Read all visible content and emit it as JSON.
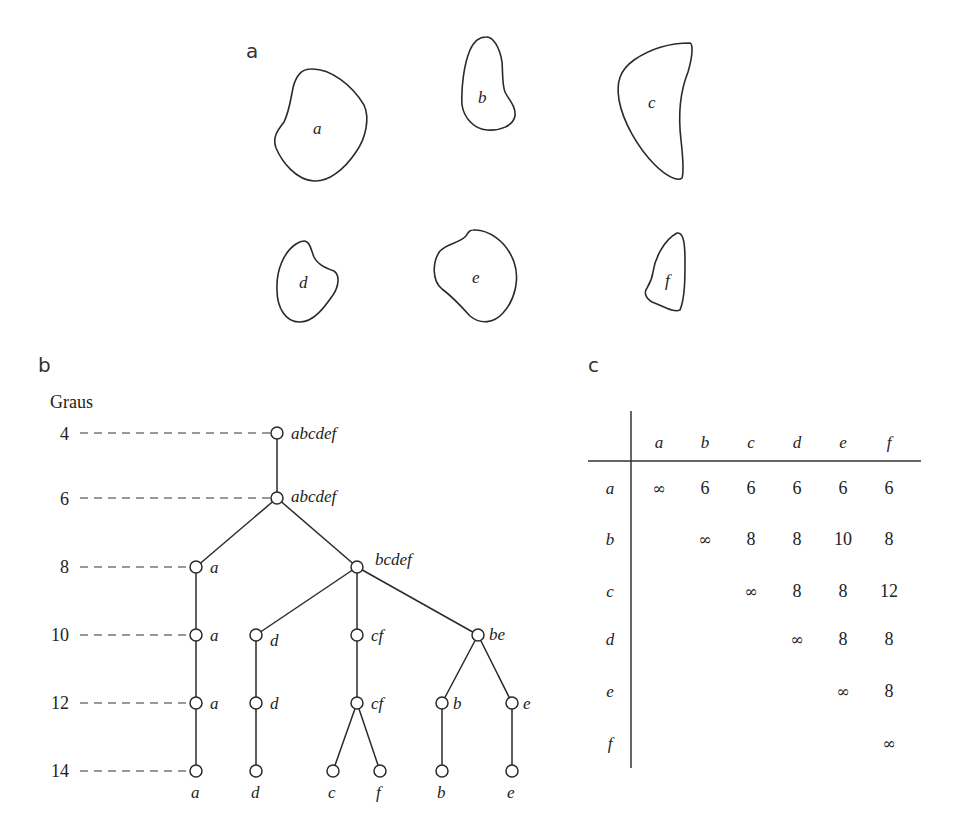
{
  "panels": {
    "a": {
      "label": "a"
    },
    "b": {
      "label": "b"
    },
    "c": {
      "label": "c"
    }
  },
  "shapes": [
    {
      "id": "a",
      "label": "a"
    },
    {
      "id": "b",
      "label": "b"
    },
    {
      "id": "c",
      "label": "c"
    },
    {
      "id": "d",
      "label": "d"
    },
    {
      "id": "e",
      "label": "e"
    },
    {
      "id": "f",
      "label": "f"
    }
  ],
  "dendrogram": {
    "axis_title": "Graus",
    "levels": [
      "4",
      "6",
      "8",
      "10",
      "12",
      "14"
    ],
    "nodes": {
      "l4_root": "abcdef",
      "l6_root": "abcdef",
      "l8_a": "a",
      "l8_bcdef": "bcdef",
      "l10_a": "a",
      "l10_d": "d",
      "l10_cf": "cf",
      "l10_be": "be",
      "l12_a": "a",
      "l12_d": "d",
      "l12_cf": "cf",
      "l12_b": "b",
      "l12_e": "e",
      "l14_a": "a",
      "l14_d": "d",
      "l14_c": "c",
      "l14_f": "f",
      "l14_b": "b",
      "l14_e": "e"
    }
  },
  "matrix": {
    "columns": [
      "a",
      "b",
      "c",
      "d",
      "e",
      "f"
    ],
    "rows": [
      {
        "label": "a",
        "cells": [
          "∞",
          "6",
          "6",
          "6",
          "6",
          "6"
        ]
      },
      {
        "label": "b",
        "cells": [
          "",
          "∞",
          "8",
          "8",
          "10",
          "8"
        ]
      },
      {
        "label": "c",
        "cells": [
          "",
          "",
          "∞",
          "8",
          "8",
          "12"
        ]
      },
      {
        "label": "d",
        "cells": [
          "",
          "",
          "",
          "∞",
          "8",
          "8"
        ]
      },
      {
        "label": "e",
        "cells": [
          "",
          "",
          "",
          "",
          "∞",
          "8"
        ]
      },
      {
        "label": "f",
        "cells": [
          "",
          "",
          "",
          "",
          "",
          "∞"
        ]
      }
    ]
  }
}
